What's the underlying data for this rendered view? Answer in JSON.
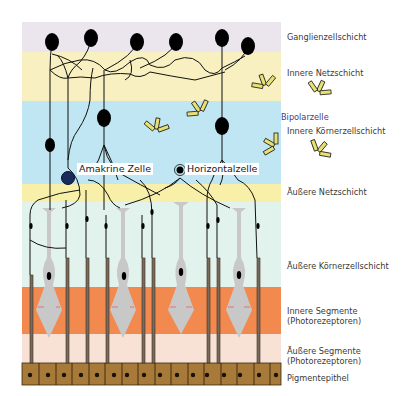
{
  "diagram": {
    "layers": [
      {
        "id": "ganglion",
        "label": "Ganglienzellschicht",
        "color": "#ebe6ee",
        "top": 22,
        "bottom": 52
      },
      {
        "id": "inner_plexiform",
        "label": "Innere Netzschicht",
        "color": "#f8f0c0",
        "top": 52,
        "bottom": 101
      },
      {
        "id": "inner_nuclear",
        "label": "Innere Körnerzellschicht",
        "color": "#bfe6f2",
        "top": 101,
        "bottom": 184
      },
      {
        "id": "outer_plexiform",
        "label": "Äußere Netzschicht",
        "color": "#f8f0a8",
        "top": 184,
        "bottom": 202
      },
      {
        "id": "outer_nuclear",
        "label": "Äußere Körnerzellschicht",
        "color": "#e2f2ec",
        "top": 202,
        "bottom": 287
      },
      {
        "id": "inner_segments",
        "label_line1": "Innere Segmente",
        "label_line2": "(Photorezeptoren)",
        "color": "#f28a50",
        "top": 287,
        "bottom": 334
      },
      {
        "id": "outer_segments",
        "label_line1": "Äußere Segmente",
        "label_line2": "(Photorezeptoren)",
        "color": "#f8e2d6",
        "top": 334,
        "bottom": 363
      },
      {
        "id": "pigment_epithelium",
        "label": "Pigmentepithel",
        "color": "#a87a3a",
        "top": 363,
        "bottom": 385
      }
    ],
    "cell_labels": {
      "amacrine": "Amakrine Zelle",
      "horizontal": "Horizontalzelle",
      "bipolar": "Bipolarzelle"
    },
    "colors": {
      "neuron": "#000000",
      "amacrine_fill": "#1a2a5a",
      "photoreceptor": "#c8c8c8",
      "rod": "#7a6a5a",
      "antibody_fill": "#e8e070",
      "antibody_stroke": "#1a1a1a",
      "epithelium_nucleus": "#1a1208"
    },
    "legend_counts": {
      "ganglion_cells": 6,
      "cones": 4,
      "epithelium_cells": 16,
      "antibodies": 6
    }
  }
}
